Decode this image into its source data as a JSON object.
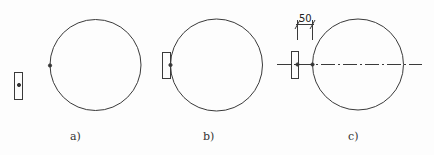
{
  "diagram": {
    "stroke_color": "#3a3a3a",
    "panels": [
      {
        "id": "a",
        "label": "a)"
      },
      {
        "id": "b",
        "label": "b)"
      },
      {
        "id": "c",
        "label": "c)",
        "dimension": "50"
      }
    ]
  }
}
